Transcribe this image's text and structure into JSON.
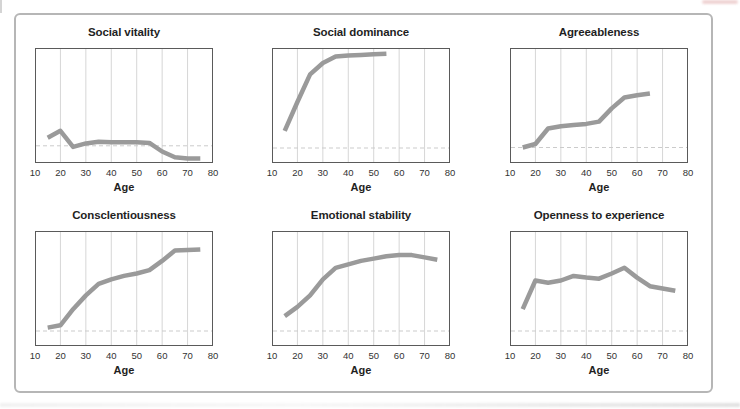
{
  "figure": {
    "description_visible_text_only": "",
    "xlabel_shared": "Age"
  },
  "style": {
    "line_color": "#9a9a9a",
    "grid_color": "#d6d6d6",
    "reference_line_color": "#cbcbcb",
    "plot_border_color": "#5a5a5a",
    "panel_border_color": "#b6b6b6",
    "background_color": "#ffffff",
    "title_color": "#1f1f1f",
    "tick_color": "#333333"
  },
  "chart_data": [
    {
      "type": "line",
      "title": "Social vitality",
      "xlabel": "Age",
      "ylabel": "",
      "xlim": [
        10,
        80
      ],
      "ylim": [
        0,
        1
      ],
      "x_ticks": [
        10,
        20,
        30,
        40,
        50,
        60,
        70,
        80
      ],
      "grid": "vertical",
      "baseline": 0.15,
      "line_color": "#9a9a9a",
      "x": [
        15,
        20,
        25,
        30,
        35,
        40,
        45,
        50,
        55,
        60,
        65,
        70,
        75
      ],
      "y": [
        0.22,
        0.28,
        0.14,
        0.17,
        0.185,
        0.18,
        0.18,
        0.18,
        0.175,
        0.1,
        0.05,
        0.04,
        0.04
      ]
    },
    {
      "type": "line",
      "title": "Social dominance",
      "xlabel": "Age",
      "ylabel": "",
      "xlim": [
        10,
        80
      ],
      "ylim": [
        0,
        1
      ],
      "x_ticks": [
        10,
        20,
        30,
        40,
        50,
        60,
        70,
        80
      ],
      "grid": "vertical",
      "baseline": 0.13,
      "line_color": "#9a9a9a",
      "x": [
        15,
        20,
        25,
        30,
        35,
        40,
        45,
        50,
        55
      ],
      "y": [
        0.28,
        0.53,
        0.77,
        0.87,
        0.925,
        0.935,
        0.94,
        0.945,
        0.95
      ]
    },
    {
      "type": "line",
      "title": "Agreeableness",
      "xlabel": "Age",
      "ylabel": "",
      "xlim": [
        10,
        80
      ],
      "ylim": [
        0,
        1
      ],
      "x_ticks": [
        10,
        20,
        30,
        40,
        50,
        60,
        70,
        80
      ],
      "grid": "vertical",
      "baseline": 0.135,
      "line_color": "#9a9a9a",
      "x": [
        15,
        20,
        25,
        30,
        35,
        40,
        45,
        50,
        55,
        60,
        65
      ],
      "y": [
        0.135,
        0.165,
        0.3,
        0.32,
        0.33,
        0.34,
        0.36,
        0.475,
        0.57,
        0.59,
        0.605
      ]
    },
    {
      "type": "line",
      "title": "Consclentiousness",
      "xlabel": "Age",
      "ylabel": "",
      "xlim": [
        10,
        80
      ],
      "ylim": [
        0,
        1
      ],
      "x_ticks": [
        10,
        20,
        30,
        40,
        50,
        60,
        70,
        80
      ],
      "grid": "vertical",
      "baseline": 0.13,
      "line_color": "#9a9a9a",
      "x": [
        15,
        20,
        25,
        30,
        35,
        40,
        45,
        50,
        55,
        60,
        65,
        70,
        75
      ],
      "y": [
        0.16,
        0.18,
        0.32,
        0.44,
        0.54,
        0.58,
        0.61,
        0.63,
        0.66,
        0.74,
        0.83,
        0.835,
        0.84
      ]
    },
    {
      "type": "line",
      "title": "Emotional stability",
      "xlabel": "Age",
      "ylabel": "",
      "xlim": [
        10,
        80
      ],
      "ylim": [
        0,
        1
      ],
      "x_ticks": [
        10,
        20,
        30,
        40,
        50,
        60,
        70,
        80
      ],
      "grid": "vertical",
      "baseline": 0.13,
      "line_color": "#9a9a9a",
      "x": [
        15,
        20,
        25,
        30,
        35,
        40,
        45,
        50,
        55,
        60,
        65,
        70,
        75
      ],
      "y": [
        0.26,
        0.34,
        0.44,
        0.58,
        0.68,
        0.71,
        0.74,
        0.76,
        0.78,
        0.79,
        0.79,
        0.77,
        0.75
      ]
    },
    {
      "type": "line",
      "title": "Openness to experience",
      "xlabel": "Age",
      "ylabel": "",
      "xlim": [
        10,
        80
      ],
      "ylim": [
        0,
        1
      ],
      "x_ticks": [
        10,
        20,
        30,
        40,
        50,
        60,
        70,
        80
      ],
      "grid": "vertical",
      "baseline": 0.13,
      "line_color": "#9a9a9a",
      "x": [
        15,
        20,
        25,
        30,
        35,
        40,
        45,
        50,
        55,
        60,
        65,
        70,
        75
      ],
      "y": [
        0.32,
        0.57,
        0.55,
        0.57,
        0.61,
        0.595,
        0.585,
        0.63,
        0.68,
        0.595,
        0.52,
        0.5,
        0.48
      ]
    }
  ]
}
